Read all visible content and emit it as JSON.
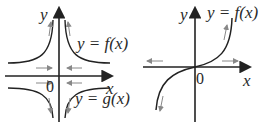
{
  "left": {
    "y_axis": "y",
    "x_axis": "x",
    "origin": "0",
    "curve_top": "y = f(x)",
    "curve_bottom": "y = g(x)"
  },
  "right": {
    "y_axis": "y",
    "x_axis": "x",
    "origin": "0",
    "curve": "y = f(x)"
  }
}
